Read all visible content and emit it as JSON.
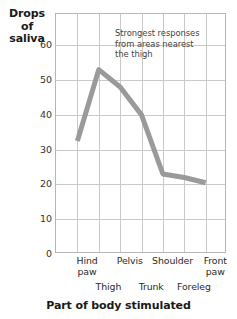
{
  "chart_data": {
    "type": "line",
    "title": "",
    "xlabel": "Part of body stimulated",
    "ylabel": "Drops of saliva",
    "ylabel_lines": [
      "Drops",
      "of",
      "saliva"
    ],
    "categories": [
      "Hind paw",
      "Thigh",
      "Pelvis",
      "Trunk",
      "Shoulder",
      "Foreleg",
      "Front paw"
    ],
    "values": [
      32.5,
      53,
      48,
      40,
      23,
      22,
      20.5
    ],
    "series": [
      {
        "name": "Drops of saliva",
        "color": "#9a9a9a",
        "values": [
          32.5,
          53,
          48,
          40,
          23,
          22,
          20.5
        ]
      }
    ],
    "yticks": [
      0,
      10,
      20,
      30,
      40,
      50,
      60
    ],
    "ytick_labels": [
      "0",
      "10",
      "20",
      "30",
      "40",
      "50",
      "60"
    ],
    "ylim": [
      0,
      69
    ],
    "xlim": [
      0,
      8
    ],
    "grid": true,
    "legend": "none",
    "annotations": [
      {
        "text": "Strongest responses from areas nearest the thigh",
        "lines": [
          "Strongest responses",
          "from areas nearest",
          "the thigh"
        ]
      }
    ],
    "x_labels_top": [
      "Hind\npaw",
      "Pelvis",
      "Shoulder",
      "Front\npaw"
    ],
    "x_labels_bottom": [
      "Thigh",
      "Trunk",
      "Foreleg"
    ],
    "line_color": "#9a9a9a",
    "grid_color": "#c9c9c9",
    "frame_color": "#b6b6b6"
  }
}
